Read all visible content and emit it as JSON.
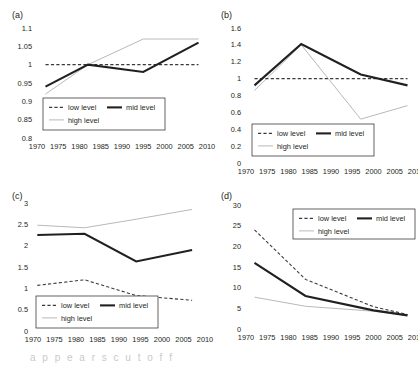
{
  "figure": {
    "background": "#ffffff",
    "panel_count": 4,
    "series_colors": {
      "low": "#3a3a3a",
      "mid": "#231f20",
      "high": "#b9b9b9"
    },
    "legend_labels": {
      "low": "low level",
      "mid": "mid level",
      "high": "high level"
    },
    "bottom_caption_partial": "a  p  p  e  a  r  s     c  u  t     o  f  f"
  },
  "panels": [
    {
      "label": "(a)",
      "ytick_labels": [
        "1.1",
        "1.05",
        "1",
        "0.95",
        "0.9",
        "0.85",
        "0.8"
      ],
      "xtick_labels": [
        "1970",
        "1975",
        "1980",
        "1985",
        "1990",
        "1995",
        "2000",
        "2005",
        "2010"
      ]
    },
    {
      "label": "(b)",
      "ytick_labels": [
        "1.6",
        "1.4",
        "1.2",
        "1",
        "0.8",
        "0.6",
        "0.4",
        "0.2",
        "0"
      ],
      "xtick_labels": [
        "1970",
        "1975",
        "1980",
        "1985",
        "1990",
        "1995",
        "2000",
        "2005",
        "2010"
      ]
    },
    {
      "label": "(c)",
      "ytick_labels": [
        "3",
        "2.5",
        "2",
        "1.5",
        "1",
        "0.5",
        "0"
      ],
      "xtick_labels": [
        "1970",
        "1975",
        "1980",
        "1985",
        "1990",
        "1995",
        "2000",
        "2005",
        "2010"
      ]
    },
    {
      "label": "(d)",
      "ytick_labels": [
        "30",
        "25",
        "20",
        "15",
        "10",
        "5",
        "0"
      ],
      "xtick_labels": [
        "1970",
        "1975",
        "1980",
        "1985",
        "1990",
        "1995",
        "2000",
        "2005",
        "2010"
      ]
    }
  ],
  "chart_data": [
    {
      "type": "line",
      "title": "(a)",
      "xlabel": "",
      "ylabel": "",
      "xlim": [
        1970,
        2010
      ],
      "ylim": [
        0.8,
        1.1
      ],
      "ytick_values": [
        0.8,
        0.85,
        0.9,
        0.95,
        1.0,
        1.05,
        1.1
      ],
      "xtick_values": [
        1970,
        1975,
        1980,
        1985,
        1990,
        1995,
        2000,
        2005,
        2010
      ],
      "grid": false,
      "legend_position": "lower-center-left",
      "series": [
        {
          "name": "low level",
          "style": "dashed",
          "x": [
            1972,
            1982,
            1995,
            2008
          ],
          "values": [
            1.0,
            1.0,
            1.0,
            1.0
          ]
        },
        {
          "name": "mid level",
          "style": "solid-thick",
          "x": [
            1972,
            1982,
            1995,
            2008
          ],
          "values": [
            0.94,
            1.0,
            0.98,
            1.06
          ]
        },
        {
          "name": "high level",
          "style": "solid-thin",
          "x": [
            1972,
            1982,
            1995,
            2008
          ],
          "values": [
            0.92,
            1.0,
            1.07,
            1.07
          ]
        }
      ]
    },
    {
      "type": "line",
      "title": "(b)",
      "xlabel": "",
      "ylabel": "",
      "xlim": [
        1970,
        2010
      ],
      "ylim": [
        0,
        1.6
      ],
      "ytick_values": [
        0,
        0.2,
        0.4,
        0.6,
        0.8,
        1.0,
        1.2,
        1.4,
        1.6
      ],
      "xtick_values": [
        1970,
        1975,
        1980,
        1985,
        1990,
        1995,
        2000,
        2005,
        2010
      ],
      "grid": false,
      "legend_position": "lower-center-left",
      "series": [
        {
          "name": "low level",
          "style": "dashed",
          "x": [
            1972,
            1983,
            1997,
            2008
          ],
          "values": [
            1.0,
            1.0,
            1.0,
            1.0
          ]
        },
        {
          "name": "mid level",
          "style": "solid-thick",
          "x": [
            1972,
            1983,
            1997,
            2008
          ],
          "values": [
            0.92,
            1.41,
            1.05,
            0.92
          ]
        },
        {
          "name": "high level",
          "style": "solid-thin",
          "x": [
            1972,
            1983,
            1997,
            2008
          ],
          "values": [
            0.86,
            1.4,
            0.52,
            0.68
          ]
        }
      ]
    },
    {
      "type": "line",
      "title": "(c)",
      "xlabel": "",
      "ylabel": "",
      "xlim": [
        1970,
        2010
      ],
      "ylim": [
        0,
        3
      ],
      "ytick_values": [
        0,
        0.5,
        1.0,
        1.5,
        2.0,
        2.5,
        3.0
      ],
      "xtick_values": [
        1970,
        1975,
        1980,
        1985,
        1990,
        1995,
        2000,
        2005,
        2010
      ],
      "grid": false,
      "legend_position": "lower-left",
      "series": [
        {
          "name": "low level",
          "style": "dashed",
          "x": [
            1971,
            1982,
            1994,
            2007
          ],
          "values": [
            1.07,
            1.2,
            0.83,
            0.72
          ]
        },
        {
          "name": "mid level",
          "style": "solid-thick",
          "x": [
            1971,
            1982,
            1994,
            2007
          ],
          "values": [
            2.25,
            2.28,
            1.63,
            1.9
          ]
        },
        {
          "name": "high level",
          "style": "solid-thin",
          "x": [
            1971,
            1982,
            1994,
            2007
          ],
          "values": [
            2.48,
            2.42,
            2.62,
            2.85
          ]
        }
      ]
    },
    {
      "type": "line",
      "title": "(d)",
      "xlabel": "",
      "ylabel": "",
      "xlim": [
        1970,
        2010
      ],
      "ylim": [
        0,
        30
      ],
      "ytick_values": [
        0,
        5,
        10,
        15,
        20,
        25,
        30
      ],
      "xtick_values": [
        1970,
        1975,
        1980,
        1985,
        1990,
        1995,
        2000,
        2005,
        2010
      ],
      "grid": false,
      "legend_position": "upper-right",
      "series": [
        {
          "name": "low level",
          "style": "dashed",
          "x": [
            1972,
            1984,
            2000,
            2008
          ],
          "values": [
            24.0,
            12.0,
            5.4,
            3.5
          ]
        },
        {
          "name": "mid level",
          "style": "solid-thick",
          "x": [
            1972,
            1984,
            2000,
            2008
          ],
          "values": [
            16.0,
            8.0,
            4.5,
            3.3
          ]
        },
        {
          "name": "high level",
          "style": "solid-thin",
          "x": [
            1972,
            1984,
            2000,
            2008
          ],
          "values": [
            7.7,
            5.5,
            4.3,
            3.3
          ]
        }
      ]
    }
  ]
}
